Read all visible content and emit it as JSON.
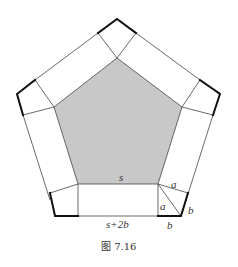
{
  "figure": {
    "caption": "图 7.16",
    "colors": {
      "background": "#ffffff",
      "inner_fill": "#c8c8c8",
      "line": "#444444",
      "thick_line": "#111111",
      "text": "#333333"
    },
    "labels": {
      "inner_side": "s",
      "outer_side": "s+2b",
      "a_top": "a",
      "a_left": "a",
      "b_right": "b",
      "b_bottom": "b"
    },
    "shapes": {
      "inner_pentagon": "regular pentagon with side s (shaded gray)",
      "outer_pentagon": "regular pentagon with side s+2b",
      "side_rectangles": 5,
      "corner_kites": 5
    }
  }
}
